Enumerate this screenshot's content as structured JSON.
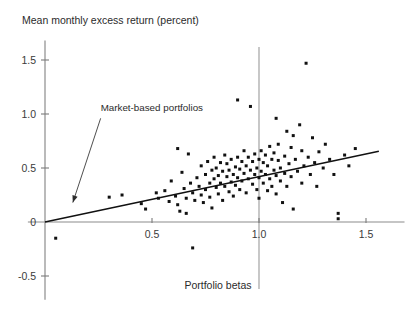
{
  "chart_data": {
    "type": "scatter",
    "title": "",
    "ylabel": "Mean monthly excess return (percent)",
    "xlabel": "Portfolio betas",
    "xlim": [
      -0.08,
      1.68
    ],
    "ylim": [
      -0.72,
      1.68
    ],
    "xticks": [
      0.5,
      1.0,
      1.5
    ],
    "xtick_labels": [
      "0.5",
      "1.0",
      "1.5"
    ],
    "yticks": [
      -0.5,
      0,
      0.5,
      1.0,
      1.5
    ],
    "ytick_labels": [
      "-0.5",
      "0",
      "0.5",
      "1.0",
      "1.5"
    ],
    "grid": false,
    "legend": "none",
    "annotations": [
      {
        "text": "Market-based portfolios",
        "text_x": 0.26,
        "text_y": 1.03,
        "arrow_from_x": 0.26,
        "arrow_from_y": 0.96,
        "arrow_to_x": 0.13,
        "arrow_to_y": 0.18
      }
    ],
    "reference_lines": [
      {
        "name": "market-beta-reference",
        "orientation": "vertical",
        "x": 1.0,
        "y_from": -0.62,
        "y_to": 1.62,
        "color": "#9a9a9a"
      }
    ],
    "fit_line": {
      "name": "security-market-line",
      "intercept": 0.0,
      "slope": 0.42,
      "x_from": 0.0,
      "x_to": 1.56,
      "color": "#111111"
    },
    "series": [
      {
        "name": "Portfolios",
        "marker": "square",
        "color": "#111111",
        "points": [
          [
            0.05,
            -0.15
          ],
          [
            0.3,
            0.23
          ],
          [
            0.36,
            0.25
          ],
          [
            0.45,
            0.17
          ],
          [
            0.47,
            0.12
          ],
          [
            0.52,
            0.27
          ],
          [
            0.53,
            0.22
          ],
          [
            0.56,
            0.29
          ],
          [
            0.58,
            0.19
          ],
          [
            0.59,
            0.38
          ],
          [
            0.61,
            0.24
          ],
          [
            0.62,
            0.16
          ],
          [
            0.63,
            0.1
          ],
          [
            0.64,
            0.46
          ],
          [
            0.65,
            0.31
          ],
          [
            0.66,
            0.22
          ],
          [
            0.66,
            0.08
          ],
          [
            0.67,
            0.63
          ],
          [
            0.68,
            0.36
          ],
          [
            0.69,
            0.27
          ],
          [
            0.69,
            -0.24
          ],
          [
            0.7,
            0.2
          ],
          [
            0.71,
            0.41
          ],
          [
            0.72,
            0.33
          ],
          [
            0.73,
            0.25
          ],
          [
            0.73,
            0.52
          ],
          [
            0.74,
            0.18
          ],
          [
            0.75,
            0.44
          ],
          [
            0.75,
            0.3
          ],
          [
            0.76,
            0.56
          ],
          [
            0.77,
            0.36
          ],
          [
            0.77,
            0.23
          ],
          [
            0.78,
            0.48
          ],
          [
            0.78,
            0.13
          ],
          [
            0.79,
            0.4
          ],
          [
            0.79,
            0.6
          ],
          [
            0.8,
            0.32
          ],
          [
            0.8,
            0.5
          ],
          [
            0.81,
            0.26
          ],
          [
            0.81,
            0.43
          ],
          [
            0.82,
            0.55
          ],
          [
            0.82,
            0.36
          ],
          [
            0.83,
            0.2
          ],
          [
            0.83,
            0.47
          ],
          [
            0.84,
            0.62
          ],
          [
            0.84,
            0.33
          ],
          [
            0.85,
            0.42
          ],
          [
            0.85,
            0.54
          ],
          [
            0.86,
            0.28
          ],
          [
            0.86,
            0.48
          ],
          [
            0.87,
            0.37
          ],
          [
            0.87,
            0.58
          ],
          [
            0.88,
            0.44
          ],
          [
            0.88,
            0.24
          ],
          [
            0.89,
            0.51
          ],
          [
            0.89,
            0.34
          ],
          [
            0.9,
            0.6
          ],
          [
            0.9,
            0.41
          ],
          [
            0.91,
            0.3
          ],
          [
            0.91,
            0.49
          ],
          [
            0.92,
            0.56
          ],
          [
            0.92,
            0.38
          ],
          [
            0.93,
            0.66
          ],
          [
            0.93,
            0.45
          ],
          [
            0.94,
            0.27
          ],
          [
            0.94,
            0.52
          ],
          [
            0.95,
            0.6
          ],
          [
            0.95,
            0.4
          ],
          [
            0.96,
            0.48
          ],
          [
            0.96,
            1.07
          ],
          [
            0.97,
            0.35
          ],
          [
            0.97,
            0.56
          ],
          [
            0.98,
            0.44
          ],
          [
            0.98,
            0.63
          ],
          [
            0.99,
            0.3
          ],
          [
            0.99,
            0.5
          ],
          [
            1.0,
            0.58
          ],
          [
            1.0,
            0.41
          ],
          [
            1.0,
            0.22
          ],
          [
            1.01,
            0.66
          ],
          [
            1.01,
            0.47
          ],
          [
            1.02,
            0.36
          ],
          [
            1.02,
            0.55
          ],
          [
            1.03,
            0.62
          ],
          [
            1.03,
            0.44
          ],
          [
            1.04,
            0.29
          ],
          [
            1.04,
            0.52
          ],
          [
            1.05,
            0.7
          ],
          [
            1.05,
            0.4
          ],
          [
            1.06,
            0.58
          ],
          [
            1.06,
            0.33
          ],
          [
            1.07,
            0.48
          ],
          [
            1.07,
            0.64
          ],
          [
            1.08,
            0.26
          ],
          [
            1.08,
            0.43
          ],
          [
            1.09,
            0.57
          ],
          [
            1.09,
            0.72
          ],
          [
            1.1,
            0.38
          ],
          [
            1.1,
            0.5
          ],
          [
            1.11,
            0.18
          ],
          [
            1.12,
            0.61
          ],
          [
            1.12,
            0.45
          ],
          [
            1.13,
            0.84
          ],
          [
            1.13,
            0.33
          ],
          [
            1.14,
            0.54
          ],
          [
            1.15,
            0.69
          ],
          [
            1.15,
            0.42
          ],
          [
            1.16,
            0.12
          ],
          [
            1.17,
            0.58
          ],
          [
            1.18,
            0.47
          ],
          [
            1.19,
            0.9
          ],
          [
            1.2,
            0.66
          ],
          [
            1.2,
            0.36
          ],
          [
            1.21,
            0.52
          ],
          [
            1.22,
            1.47
          ],
          [
            1.23,
            0.6
          ],
          [
            1.24,
            0.44
          ],
          [
            1.25,
            0.78
          ],
          [
            1.26,
            0.55
          ],
          [
            1.27,
            0.33
          ],
          [
            1.28,
            0.65
          ],
          [
            1.3,
            0.5
          ],
          [
            1.31,
            0.72
          ],
          [
            1.33,
            0.58
          ],
          [
            1.35,
            0.44
          ],
          [
            1.37,
            0.08
          ],
          [
            1.37,
            0.03
          ],
          [
            1.4,
            0.62
          ],
          [
            1.42,
            0.52
          ],
          [
            1.45,
            0.68
          ],
          [
            0.62,
            0.68
          ],
          [
            0.9,
            1.13
          ],
          [
            1.08,
            0.96
          ],
          [
            1.16,
            0.8
          ]
        ]
      }
    ]
  }
}
